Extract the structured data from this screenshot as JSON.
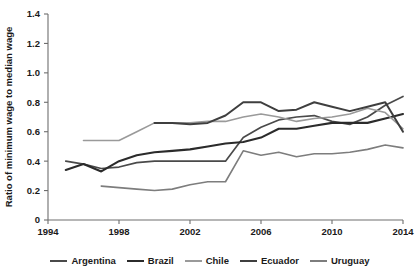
{
  "chart_data": {
    "type": "line",
    "title": "",
    "xlabel": "",
    "ylabel": "Ratio of minimum wage to median wage",
    "xlim": [
      1994,
      2014
    ],
    "ylim": [
      0,
      1.4
    ],
    "grid": false,
    "legend_position": "bottom",
    "xticks": [
      1994,
      1998,
      2002,
      2006,
      2010,
      2014
    ],
    "xtick_labels": [
      "1994",
      "1998",
      "2002",
      "2006",
      "2010",
      "2014"
    ],
    "yticks": [
      0,
      0.2,
      0.4,
      0.6,
      0.8,
      1.0,
      1.2,
      1.4
    ],
    "ytick_labels": [
      "0",
      "0.2",
      "0.4",
      "0.6",
      "0.8",
      "1.0",
      "1.2",
      "1.4"
    ],
    "series": [
      {
        "name": "Argentina",
        "color": "#4a4a4a",
        "width": 1.7,
        "x": [
          1995,
          1996,
          1997,
          1998,
          1999,
          2000,
          2001,
          2002,
          2003,
          2004,
          2005,
          2006,
          2007,
          2008,
          2009,
          2010,
          2011,
          2012,
          2013,
          2014
        ],
        "values": [
          0.4,
          0.38,
          0.35,
          0.36,
          0.39,
          0.4,
          0.4,
          0.4,
          0.4,
          0.4,
          0.56,
          0.63,
          0.68,
          0.7,
          0.71,
          0.67,
          0.65,
          0.7,
          0.78,
          0.84
        ]
      },
      {
        "name": "Brazil",
        "color": "#2b2b2b",
        "width": 2.1,
        "x": [
          1995,
          1996,
          1997,
          1998,
          1999,
          2000,
          2001,
          2002,
          2003,
          2004,
          2005,
          2006,
          2007,
          2008,
          2009,
          2010,
          2011,
          2012,
          2013,
          2014
        ],
        "values": [
          0.34,
          0.38,
          0.33,
          0.4,
          0.44,
          0.46,
          0.47,
          0.48,
          0.5,
          0.52,
          0.53,
          0.56,
          0.62,
          0.62,
          0.64,
          0.66,
          0.66,
          0.66,
          0.69,
          0.72
        ]
      },
      {
        "name": "Chile",
        "color": "#9a9a9a",
        "width": 1.6,
        "x": [
          1996,
          1997,
          1998,
          1999,
          2000,
          2001,
          2002,
          2003,
          2004,
          2005,
          2006,
          2007,
          2008,
          2009,
          2010,
          2011,
          2012,
          2013,
          2014
        ],
        "values": [
          0.54,
          0.54,
          0.54,
          0.6,
          0.66,
          0.66,
          0.66,
          0.67,
          0.67,
          0.7,
          0.72,
          0.7,
          0.67,
          0.69,
          0.7,
          0.72,
          0.76,
          0.73,
          0.62
        ]
      },
      {
        "name": "Ecuador",
        "color": "#3f3f3f",
        "width": 2.0,
        "x": [
          2000,
          2001,
          2002,
          2003,
          2004,
          2005,
          2006,
          2007,
          2008,
          2009,
          2010,
          2011,
          2012,
          2013,
          2014
        ],
        "values": [
          0.66,
          0.66,
          0.65,
          0.66,
          0.71,
          0.8,
          0.8,
          0.74,
          0.75,
          0.8,
          0.77,
          0.74,
          0.77,
          0.8,
          0.6
        ]
      },
      {
        "name": "Uruguay",
        "color": "#7d7d7d",
        "width": 1.6,
        "x": [
          1997,
          1998,
          1999,
          2000,
          2001,
          2002,
          2003,
          2004,
          2005,
          2006,
          2007,
          2008,
          2009,
          2010,
          2011,
          2012,
          2013,
          2014
        ],
        "values": [
          0.23,
          0.22,
          0.21,
          0.2,
          0.21,
          0.24,
          0.26,
          0.26,
          0.47,
          0.44,
          0.46,
          0.43,
          0.45,
          0.45,
          0.46,
          0.48,
          0.51,
          0.49
        ]
      }
    ]
  },
  "legend": {
    "items": [
      {
        "label": "Argentina"
      },
      {
        "label": "Brazil"
      },
      {
        "label": "Chile"
      },
      {
        "label": "Ecuador"
      },
      {
        "label": "Uruguay"
      }
    ]
  }
}
